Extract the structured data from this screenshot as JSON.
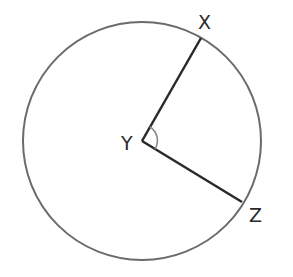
{
  "diagram": {
    "type": "circle-central-angle",
    "circle": {
      "cx": 142,
      "cy": 141,
      "r": 119,
      "stroke": "#6b6b6b"
    },
    "center": {
      "label": "Y",
      "x": 142,
      "y": 141
    },
    "points": [
      {
        "label": "X",
        "x": 201,
        "y": 38
      },
      {
        "label": "Z",
        "x": 242,
        "y": 202
      }
    ],
    "segments": [
      {
        "from": "Y",
        "to": "X",
        "stroke": "#2a2a2a"
      },
      {
        "from": "Y",
        "to": "Z",
        "stroke": "#2a2a2a"
      }
    ],
    "angle_marker": {
      "at": "Y",
      "between": [
        "X",
        "Z"
      ],
      "stroke": "#8a8a8a"
    }
  },
  "labels": {
    "x": "X",
    "y": "Y",
    "z": "Z"
  }
}
